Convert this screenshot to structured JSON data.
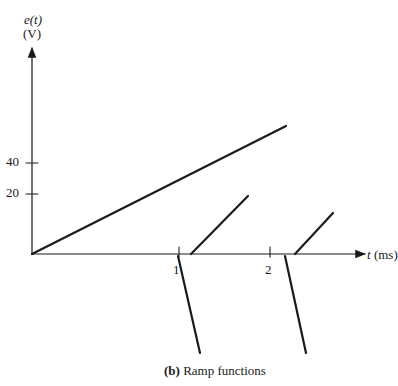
{
  "chart_data": {
    "type": "line",
    "title": "",
    "caption_prefix": "(b)",
    "caption_text": "Ramp functions",
    "ylabel_line1": "e(t)",
    "ylabel_line2": "(V)",
    "xlabel": "t (ms)",
    "yticks": [
      {
        "value": 40,
        "label": "40"
      },
      {
        "value": 20,
        "label": "20"
      }
    ],
    "xticks": [
      {
        "value": 1,
        "label": "1"
      },
      {
        "value": 2,
        "label": "2"
      }
    ],
    "grid": false,
    "legend": null,
    "series": [
      {
        "name": "ramp starting at t=0",
        "points": [
          [
            0,
            0
          ],
          [
            2.8,
            42
          ]
        ]
      },
      {
        "name": "ramp starting at t≈1.1 ms",
        "points": [
          [
            1.1,
            0
          ],
          [
            1.9,
            28
          ]
        ]
      },
      {
        "name": "ramp starting at t≈2.2 ms",
        "points": [
          [
            2.2,
            0
          ],
          [
            2.6,
            13
          ]
        ]
      },
      {
        "name": "negative ramp starting at t=1",
        "points": [
          [
            1.0,
            0
          ],
          [
            1.15,
            -33
          ]
        ]
      },
      {
        "name": "negative ramp starting at t=2",
        "points": [
          [
            2.0,
            0
          ],
          [
            2.2,
            -33
          ]
        ]
      }
    ],
    "pixel_geometry": {
      "origin": [
        32,
        254
      ],
      "y_axis_top": 48,
      "x_axis_right": 365,
      "tick_y40": 163,
      "tick_y20": 194,
      "tick_x1": 179,
      "tick_x2": 270,
      "segments": [
        [
          32,
          254,
          286,
          126
        ],
        [
          191,
          254,
          248,
          196
        ],
        [
          295,
          254,
          333,
          213
        ],
        [
          178,
          256,
          200,
          353
        ],
        [
          285,
          256,
          306,
          353
        ]
      ]
    }
  }
}
